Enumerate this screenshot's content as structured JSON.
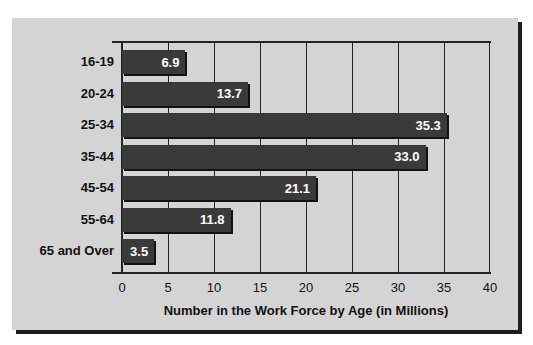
{
  "chart_data": {
    "type": "bar",
    "orientation": "horizontal",
    "title": "",
    "categories": [
      "16-19",
      "20-24",
      "25-34",
      "35-44",
      "45-54",
      "55-64",
      "65 and Over"
    ],
    "values": [
      6.9,
      13.7,
      35.3,
      33.0,
      21.1,
      11.8,
      3.5
    ],
    "value_labels": [
      "6.9",
      "13.7",
      "35.3",
      "33.0",
      "21.1",
      "11.8",
      "3.5"
    ],
    "xlabel": "Number in the Work Force by Age (in Millions)",
    "ylabel": "",
    "xlim": [
      0,
      40
    ],
    "xticks": [
      "0",
      "5",
      "10",
      "15",
      "20",
      "25",
      "30",
      "35",
      "40"
    ],
    "grid": true,
    "legend": null
  },
  "colors": {
    "bar": "#3a3a3a",
    "background": "#d4d4d4",
    "label_text": "#ffffff"
  }
}
